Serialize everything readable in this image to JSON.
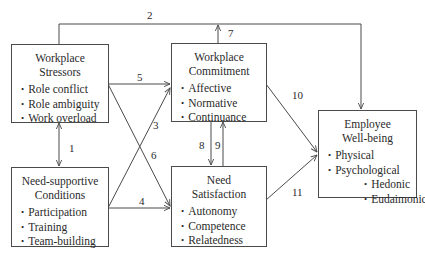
{
  "diagram": {
    "nodes": {
      "stressors": {
        "title_line1": "Workplace",
        "title_line2": "Stressors",
        "items": [
          "Role conflict",
          "Role ambiguity",
          "Work overload"
        ]
      },
      "need_supportive": {
        "title_line1": "Need-supportive",
        "title_line2": "Conditions",
        "items": [
          "Participation",
          "Training",
          "Team-building"
        ]
      },
      "commitment": {
        "title_line1": "Workplace",
        "title_line2": "Commitment",
        "items": [
          "Affective",
          "Normative",
          "Continuance"
        ]
      },
      "need_satisfaction": {
        "title_line1": "Need",
        "title_line2": "Satisfaction",
        "items": [
          "Autonomy",
          "Competence",
          "Relatedness"
        ]
      },
      "wellbeing": {
        "title_line1": "Employee",
        "title_line2": "Well-being",
        "items": [
          "Physical",
          "Psychological"
        ],
        "subitems": [
          "Hedonic",
          "Eudaimonic"
        ]
      }
    },
    "paths": {
      "p1": "1",
      "p2": "2",
      "p3": "3",
      "p4": "4",
      "p5": "5",
      "p6": "6",
      "p7": "7",
      "p8": "8",
      "p9": "9",
      "p10": "10",
      "p11": "11"
    },
    "edges": [
      {
        "label": "1",
        "from": "Workplace Stressors",
        "to": "Need-supportive Conditions",
        "bidirectional": true
      },
      {
        "label": "2",
        "from": "Workplace Stressors",
        "to": "Employee Well-being"
      },
      {
        "label": "3",
        "from": "Need-supportive Conditions",
        "to": "Workplace Commitment"
      },
      {
        "label": "4",
        "from": "Need-supportive Conditions",
        "to": "Need Satisfaction"
      },
      {
        "label": "5",
        "from": "Workplace Stressors",
        "to": "Workplace Commitment"
      },
      {
        "label": "6",
        "from": "Workplace Stressors",
        "to": "Need Satisfaction"
      },
      {
        "label": "7",
        "from": "Workplace Commitment",
        "to": "path 2 line"
      },
      {
        "label": "8",
        "from": "Workplace Commitment",
        "to": "Need Satisfaction"
      },
      {
        "label": "9",
        "from": "Need Satisfaction",
        "to": "Workplace Commitment"
      },
      {
        "label": "10",
        "from": "Workplace Commitment",
        "to": "Employee Well-being"
      },
      {
        "label": "11",
        "from": "Need Satisfaction",
        "to": "Employee Well-being"
      }
    ],
    "colors": {
      "line": "#4a4a4a",
      "text": "#2a2a2a",
      "background": "#ffffff"
    }
  }
}
